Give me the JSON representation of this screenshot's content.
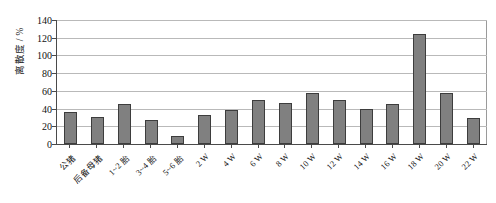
{
  "chart_data": {
    "type": "bar",
    "title": "",
    "xlabel": "",
    "ylabel": "离散度 / %",
    "ylim": [
      0,
      140
    ],
    "ytick_step": 20,
    "yticks": [
      140,
      120,
      100,
      80,
      60,
      40,
      20,
      0
    ],
    "grid": true,
    "legend": "none",
    "bar_color": "#808080",
    "bar_border_color": "#3d3d3d",
    "axis_color": "#4a4a4a",
    "gridline_color": "#b9b9b9",
    "categories": [
      "公猪",
      "后备母猪",
      "1~2 胎",
      "3~4 胎",
      "5~6 胎",
      "2 W",
      "4 W",
      "6 W",
      "8 W",
      "10 W",
      "12 W",
      "14 W",
      "16 W",
      "18 W",
      "20 W",
      "22 W"
    ],
    "values": [
      36,
      30,
      45,
      27,
      9,
      33,
      38,
      50,
      46,
      58,
      50,
      40,
      45,
      124,
      58,
      29
    ]
  }
}
